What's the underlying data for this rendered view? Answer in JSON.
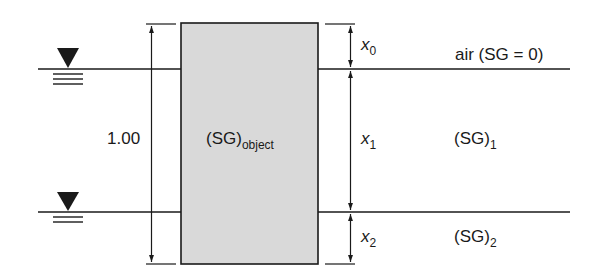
{
  "diagram": {
    "type": "buoyancy-object-two-fluid-layers",
    "colors": {
      "line": "#1a1a1a",
      "object_fill": "#d9d9d9",
      "background": "#ffffff"
    },
    "object": {
      "label_main": "(SG)",
      "label_sub": "object",
      "total_height_label": "1.00"
    },
    "dimensions": {
      "x0": {
        "symbol": "x",
        "sub": "0"
      },
      "x1": {
        "symbol": "x",
        "sub": "1"
      },
      "x2": {
        "symbol": "x",
        "sub": "2"
      }
    },
    "layers": {
      "top": {
        "label": "air (SG = 0)"
      },
      "middle": {
        "label_main": "(SG)",
        "label_sub": "1"
      },
      "bottom": {
        "label_main": "(SG)",
        "label_sub": "2"
      }
    },
    "surface_symbols": [
      {
        "name": "upper-free-surface"
      },
      {
        "name": "interface-surface"
      }
    ]
  }
}
